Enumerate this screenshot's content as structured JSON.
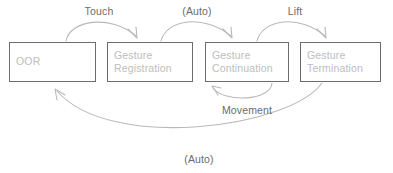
{
  "diagram": {
    "colors": {
      "box_border": "#6d6d6d",
      "box_text": "#bdbdbd",
      "edge_stroke": "#b9b9b9",
      "edge_label_text": "#6b6b6b",
      "background": "#ffffff"
    },
    "states": [
      {
        "id": "oor",
        "label": "OOR",
        "x": 9,
        "y": 42,
        "width": 87,
        "height": 40
      },
      {
        "id": "gesture-registration",
        "label": "Gesture\nRegistration",
        "x": 107,
        "y": 42,
        "width": 86,
        "height": 40
      },
      {
        "id": "gesture-continuation",
        "label": "Gesture\nContinuation",
        "x": 205,
        "y": 42,
        "width": 84,
        "height": 40
      },
      {
        "id": "gesture-termination",
        "label": "Gesture\nTermination",
        "x": 300,
        "y": 42,
        "width": 81,
        "height": 40
      }
    ],
    "transitions": [
      {
        "id": "oor-to-registration",
        "label": "Touch",
        "from": "oor",
        "to": "gesture-registration",
        "label_x": 99,
        "label_y": 5
      },
      {
        "id": "registration-to-continuation",
        "label": "(Auto)",
        "from": "gesture-registration",
        "to": "gesture-continuation",
        "label_x": 197,
        "label_y": 5
      },
      {
        "id": "continuation-to-termination",
        "label": "Lift",
        "from": "gesture-continuation",
        "to": "gesture-termination",
        "label_x": 295,
        "label_y": 5
      },
      {
        "id": "continuation-self-loop",
        "label": "Movement",
        "from": "gesture-continuation",
        "to": "gesture-continuation",
        "label_x": 247,
        "label_y": 104
      },
      {
        "id": "termination-to-oor",
        "label": "(Auto)",
        "from": "gesture-termination",
        "to": "oor",
        "label_x": 199,
        "label_y": 153
      }
    ]
  }
}
